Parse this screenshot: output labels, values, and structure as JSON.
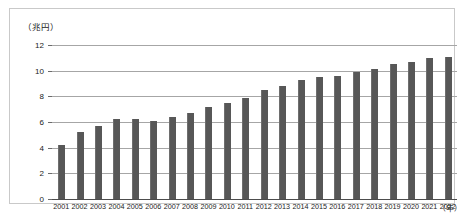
{
  "chart_data": {
    "type": "bar",
    "title": "",
    "subtitle": "",
    "xlabel": "（年）",
    "ylabel": "（兆円）",
    "ylim": [
      0,
      12
    ],
    "yticks": [
      0,
      2,
      4,
      6,
      8,
      10,
      12
    ],
    "ytick_labels": [
      "0",
      "2",
      "4",
      "6",
      "8",
      "10",
      "12"
    ],
    "grid": true,
    "legend": null,
    "bar_color": "#575757",
    "gridline_color": "#a6a6a6",
    "axis_color": "#4d4d4d",
    "categories": [
      "2001",
      "2002",
      "2003",
      "2004",
      "2005",
      "2006",
      "2007",
      "2008",
      "2009",
      "2010",
      "2011",
      "2012",
      "2013",
      "2014",
      "2015",
      "2016",
      "2017",
      "2018",
      "2019",
      "2020",
      "2021",
      "2022"
    ],
    "values": [
      4.2,
      5.2,
      5.7,
      6.2,
      6.2,
      6.1,
      6.4,
      6.7,
      7.2,
      7.5,
      7.9,
      8.5,
      8.8,
      9.3,
      9.5,
      9.6,
      9.9,
      10.1,
      10.5,
      10.7,
      11.0,
      11.1
    ]
  },
  "axes": {
    "y_unit_label": "（兆円）",
    "x_unit_label": "（年）"
  },
  "caption": {
    "text": ""
  }
}
